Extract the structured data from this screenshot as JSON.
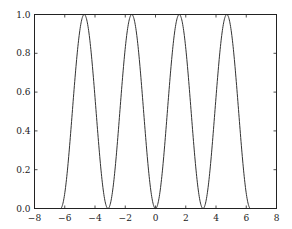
{
  "chart_data": {
    "type": "line",
    "title": "",
    "xlabel": "",
    "ylabel": "",
    "xlim": [
      -8,
      8
    ],
    "ylim": [
      0,
      1
    ],
    "grid": false,
    "legend": null,
    "x_ticks": [
      -8,
      -6,
      -4,
      -2,
      0,
      2,
      4,
      6,
      8
    ],
    "x_tick_labels": [
      "−8",
      "−6",
      "−4",
      "−2",
      "0",
      "2",
      "4",
      "6",
      "8"
    ],
    "y_ticks": [
      0.0,
      0.2,
      0.4,
      0.6,
      0.8,
      1.0
    ],
    "y_tick_labels": [
      "0.0",
      "0.2",
      "0.4",
      "0.6",
      "0.8",
      "1.0"
    ],
    "series": [
      {
        "name": "sin^2(x)",
        "function": "sin(x)^2",
        "x_range": [
          -6.2832,
          6.2832
        ],
        "color": "#333333",
        "key_points": {
          "x": [
            -6.2832,
            -4.7124,
            -3.1416,
            -1.5708,
            0,
            1.5708,
            3.1416,
            4.7124,
            6.2832
          ],
          "y": [
            0,
            1,
            0,
            1,
            0,
            1,
            0,
            1,
            0
          ]
        }
      }
    ]
  }
}
